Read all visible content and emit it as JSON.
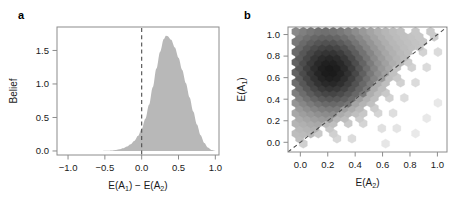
{
  "figure": {
    "panels": [
      {
        "key": "a",
        "label": "a"
      },
      {
        "key": "b",
        "label": "b"
      }
    ]
  },
  "chart_data": [
    {
      "type": "area",
      "panel": "a",
      "title": "",
      "xlabel": "E(A1) - E(A2)",
      "xlabel_parts": [
        "E(A",
        "1",
        ") − E(A",
        "2",
        ")"
      ],
      "ylabel": "Belief",
      "xlim": [
        -1.15,
        1.05
      ],
      "ylim": [
        -0.06,
        1.85
      ],
      "xticks": [
        -1.0,
        -0.5,
        0.0,
        0.5,
        1.0
      ],
      "xticklabels": [
        "-1.0",
        "-0.5",
        "0.0",
        "0.5",
        "1.0"
      ],
      "yticks": [
        0.0,
        0.5,
        1.0,
        1.5
      ],
      "yticklabels": [
        "0.0",
        "0.5",
        "1.0",
        "1.5"
      ],
      "grid": false,
      "legend": null,
      "fill_color": "#b8b8b8",
      "reference_line": {
        "x": 0.0,
        "style": "dashed",
        "color": "#4d4d4d"
      },
      "x": [
        -0.6,
        -0.55,
        -0.5,
        -0.45,
        -0.4,
        -0.35,
        -0.3,
        -0.25,
        -0.2,
        -0.15,
        -0.1,
        -0.05,
        0.0,
        0.05,
        0.1,
        0.15,
        0.2,
        0.25,
        0.3,
        0.33,
        0.35,
        0.4,
        0.45,
        0.5,
        0.55,
        0.6,
        0.65,
        0.7,
        0.75,
        0.8,
        0.85,
        0.9,
        0.95,
        1.0
      ],
      "values": [
        0.0,
        0.001,
        0.002,
        0.004,
        0.008,
        0.015,
        0.026,
        0.042,
        0.066,
        0.1,
        0.15,
        0.225,
        0.33,
        0.48,
        0.69,
        0.95,
        1.23,
        1.48,
        1.67,
        1.72,
        1.715,
        1.66,
        1.545,
        1.39,
        1.21,
        1.01,
        0.8,
        0.59,
        0.395,
        0.235,
        0.12,
        0.05,
        0.014,
        0.002
      ],
      "peak": {
        "x": 0.33,
        "y": 1.72
      }
    },
    {
      "type": "heatmap",
      "subtype": "hexbin",
      "panel": "b",
      "title": "",
      "xlabel": "E(A2)",
      "xlabel_parts": [
        "E(A",
        "2",
        ")"
      ],
      "ylabel": "E(A1)",
      "ylabel_parts": [
        "E(A",
        "1",
        ")"
      ],
      "xlim": [
        -0.09,
        1.07
      ],
      "ylim": [
        -0.09,
        1.07
      ],
      "xticks": [
        0.0,
        0.2,
        0.4,
        0.6,
        0.8,
        1.0
      ],
      "xticklabels": [
        "0.0",
        "0.2",
        "0.4",
        "0.6",
        "0.8",
        "1.0"
      ],
      "yticks": [
        0.0,
        0.2,
        0.4,
        0.6,
        0.8,
        1.0
      ],
      "yticklabels": [
        "0.0",
        "0.2",
        "0.4",
        "0.6",
        "0.8",
        "1.0"
      ],
      "grid": false,
      "legend": null,
      "colormap": {
        "low": "#f2f2f2",
        "high": "#1a1a1a"
      },
      "reference_line": {
        "type": "identity",
        "style": "dashed",
        "color": "#4d4d4d",
        "from": [
          -0.09,
          -0.09
        ],
        "to": [
          1.07,
          1.07
        ]
      },
      "mode": {
        "x": 0.23,
        "y": 0.65,
        "density": 1.0
      },
      "center_x": 0.23,
      "center_y": 0.65,
      "sigma_x": 0.175,
      "sigma_y": 0.205,
      "hex_radius_data": 0.0315
    }
  ]
}
